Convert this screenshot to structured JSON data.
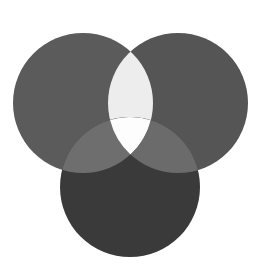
{
  "figure": {
    "title": "Three-circle Venn diagram",
    "width": 261,
    "height": 276,
    "background_color": "#ffffff",
    "blend_mode": "screen"
  },
  "chart_data": {
    "type": "diagram",
    "subtype": "venn3",
    "title": "Three-circle Venn diagram",
    "xlabel": "",
    "ylabel": "",
    "grid": false,
    "legend": false,
    "annotations": [],
    "canvas": {
      "width": 261,
      "height": 276,
      "background": "#ffffff"
    },
    "blend_mode": "screen",
    "sets": [
      {
        "name": "A",
        "position": "top-left",
        "cx": 83,
        "cy": 103,
        "r": 70,
        "color": "#5b5b5b",
        "label": ""
      },
      {
        "name": "B",
        "position": "top-right",
        "cx": 178,
        "cy": 103,
        "r": 70,
        "color": "#555555",
        "label": ""
      },
      {
        "name": "C",
        "position": "bottom-center",
        "cx": 130,
        "cy": 187,
        "r": 70,
        "color": "#3a3a3a",
        "label": ""
      }
    ],
    "regions": [
      {
        "id": "A",
        "sets": [
          "A"
        ],
        "color": "#5b5b5b",
        "label": ""
      },
      {
        "id": "B",
        "sets": [
          "B"
        ],
        "color": "#555555",
        "label": ""
      },
      {
        "id": "C",
        "sets": [
          "C"
        ],
        "color": "#3a3a3a",
        "label": ""
      },
      {
        "id": "AB",
        "sets": [
          "A",
          "B"
        ],
        "color": "#ededed",
        "label": ""
      },
      {
        "id": "AC",
        "sets": [
          "A",
          "C"
        ],
        "color": "#6e6e6e",
        "label": ""
      },
      {
        "id": "BC",
        "sets": [
          "B",
          "C"
        ],
        "color": "#6b6b6b",
        "label": ""
      },
      {
        "id": "ABC",
        "sets": [
          "A",
          "B",
          "C"
        ],
        "color": "#fdfdfd",
        "label": ""
      }
    ]
  }
}
